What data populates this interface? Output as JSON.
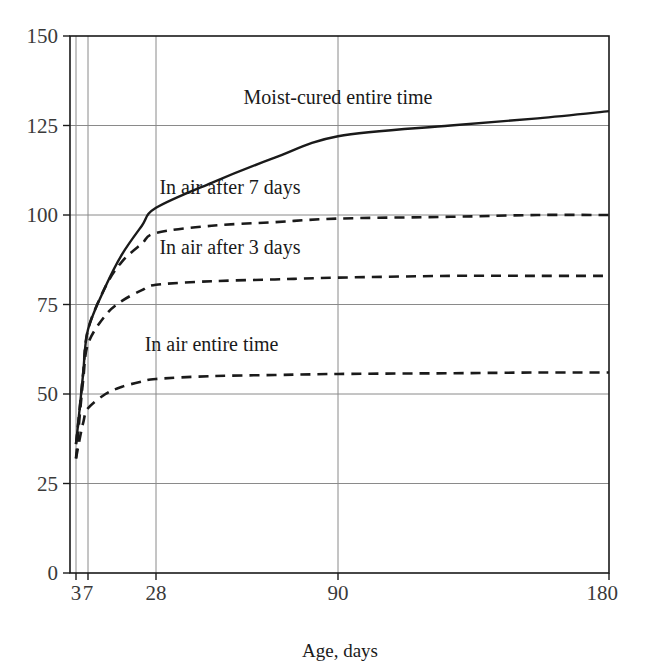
{
  "chart_data": {
    "type": "line",
    "title": "",
    "xlabel": "Age, days",
    "ylabel": "",
    "xticks": [
      3,
      7,
      28,
      90,
      180
    ],
    "xtick_labels": [
      "3",
      "7",
      "28",
      "90",
      "180"
    ],
    "yticks": [
      0,
      25,
      50,
      75,
      100,
      125,
      150
    ],
    "ytick_labels": [
      "0",
      "25",
      "50",
      "75",
      "100",
      "125",
      "150"
    ],
    "ylim": [
      0,
      150
    ],
    "xlim": [
      3,
      180
    ],
    "xscale": "log-like",
    "grid": true,
    "legend_position": "inline-annotations",
    "series": [
      {
        "name": "Moist-cured entire time",
        "style": "solid",
        "color": "#1a1a1a",
        "label_x": 90,
        "label_y": 131,
        "x": [
          3,
          4,
          5,
          7,
          10,
          14,
          21,
          28,
          40,
          60,
          90,
          120,
          150,
          180
        ],
        "values": [
          36,
          47,
          56,
          68,
          80,
          89,
          97,
          102,
          109,
          116,
          122,
          125,
          127,
          129
        ]
      },
      {
        "name": "In air after 7 days",
        "style": "dashed",
        "color": "#1a1a1a",
        "label_x": 45,
        "label_y": 106,
        "x": [
          3,
          4,
          5,
          7,
          10,
          14,
          21,
          28,
          40,
          60,
          90,
          120,
          150,
          180
        ],
        "values": [
          36,
          47,
          56,
          68,
          80,
          87,
          92,
          95,
          97,
          98,
          99,
          99.5,
          100,
          100
        ]
      },
      {
        "name": "In air after 3 days",
        "style": "dashed",
        "color": "#1a1a1a",
        "label_x": 45,
        "label_y": 89,
        "x": [
          3,
          4,
          5,
          7,
          10,
          14,
          21,
          28,
          40,
          60,
          90,
          120,
          150,
          180
        ],
        "values": [
          32,
          45,
          54,
          64,
          72,
          76,
          79,
          80.5,
          81.5,
          82,
          82.5,
          83,
          83,
          83
        ]
      },
      {
        "name": "In air entire time",
        "style": "dashed",
        "color": "#1a1a1a",
        "label_x": 40,
        "label_y": 62,
        "x": [
          3,
          4,
          5,
          7,
          10,
          14,
          21,
          28,
          40,
          60,
          90,
          120,
          150,
          180
        ],
        "values": [
          32,
          38,
          42,
          46,
          50,
          52,
          53.5,
          54.2,
          55,
          55.3,
          55.6,
          55.8,
          56,
          56
        ]
      }
    ]
  },
  "axis": {
    "x_title": "Age, days"
  }
}
